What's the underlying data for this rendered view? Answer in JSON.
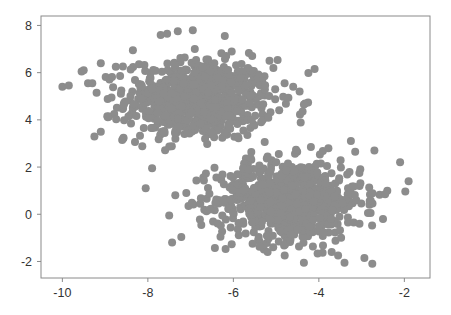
{
  "chart_data": {
    "type": "scatter",
    "title": "",
    "xlabel": "",
    "ylabel": "",
    "xlim": [
      -10.5,
      -1.4
    ],
    "ylim": [
      -2.7,
      8.4
    ],
    "x_ticks": [
      -10,
      -8,
      -6,
      -4,
      -2
    ],
    "y_ticks": [
      -2,
      0,
      2,
      4,
      6,
      8
    ],
    "x_tick_labels": [
      "-10",
      "-8",
      "-6",
      "-4",
      "-2"
    ],
    "y_tick_labels": [
      "-2",
      "0",
      "2",
      "4",
      "6",
      "8"
    ],
    "grid": false,
    "legend": null,
    "marker_color": "#8c8c8c",
    "marker_radius_px": 4,
    "series": [
      {
        "name": "cluster-1",
        "center": [
          -6.8,
          4.85
        ],
        "std": [
          0.85,
          0.85
        ],
        "count": 750,
        "x_range": [
          -10.0,
          -4.1
        ],
        "y_range": [
          2.6,
          7.8
        ]
      },
      {
        "name": "cluster-2",
        "center": [
          -4.7,
          0.6
        ],
        "std": [
          0.85,
          0.85
        ],
        "count": 750,
        "x_range": [
          -8.1,
          -1.9
        ],
        "y_range": [
          -2.2,
          3.5
        ]
      }
    ],
    "outliers": [
      [
        -10.0,
        5.4
      ],
      [
        -9.85,
        5.45
      ],
      [
        -9.55,
        6.05
      ],
      [
        -9.5,
        6.1
      ],
      [
        -9.1,
        6.4
      ],
      [
        -8.75,
        6.25
      ],
      [
        -9.2,
        5.15
      ],
      [
        -8.85,
        4.95
      ],
      [
        -9.4,
        5.55
      ],
      [
        -9.3,
        5.55
      ],
      [
        -8.95,
        4.15
      ],
      [
        -9.1,
        3.5
      ],
      [
        -9.25,
        3.3
      ],
      [
        -8.6,
        3.15
      ],
      [
        -8.35,
        6.95
      ],
      [
        -7.3,
        7.75
      ],
      [
        -6.95,
        7.8
      ],
      [
        -7.7,
        7.6
      ],
      [
        -7.55,
        7.65
      ],
      [
        -6.2,
        7.55
      ],
      [
        -4.1,
        6.15
      ],
      [
        -4.6,
        5.4
      ],
      [
        -4.45,
        5.2
      ],
      [
        -4.35,
        4.65
      ],
      [
        -4.38,
        4.35
      ],
      [
        -2.7,
        2.7
      ],
      [
        -2.1,
        2.2
      ],
      [
        -1.9,
        1.4
      ],
      [
        -2.4,
        1.0
      ],
      [
        -2.45,
        0.85
      ],
      [
        -2.5,
        -0.2
      ],
      [
        -2.85,
        0.05
      ],
      [
        -2.75,
        -2.1
      ],
      [
        -3.4,
        -2.05
      ],
      [
        -3.7,
        -1.6
      ],
      [
        -4.8,
        -1.75
      ],
      [
        -5.2,
        -1.6
      ],
      [
        -4.35,
        -2.05
      ],
      [
        -3.05,
        -0.4
      ],
      [
        -3.55,
        -1.75
      ],
      [
        -7.5,
        -0.05
      ],
      [
        -8.05,
        1.1
      ],
      [
        -7.1,
        0.9
      ],
      [
        -6.3,
        -0.95
      ],
      [
        -7.9,
        1.95
      ],
      [
        -6.75,
        -0.45
      ],
      [
        -6.55,
        0.2
      ],
      [
        -5.55,
        -1.25
      ],
      [
        -3.25,
        3.1
      ],
      [
        -3.15,
        2.65
      ]
    ]
  }
}
